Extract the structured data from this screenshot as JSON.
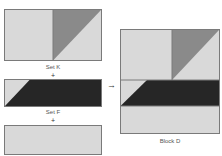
{
  "colors": {
    "light": "#d9d9d9",
    "medium": "#8a8a8a",
    "dark": "#262626",
    "outline": "#7a7a7a"
  },
  "labels": {
    "set_k": "Set K",
    "set_f": "Set F",
    "block_d": "Block D",
    "plus_1": "+",
    "plus_2": "+",
    "arrow": "→"
  }
}
